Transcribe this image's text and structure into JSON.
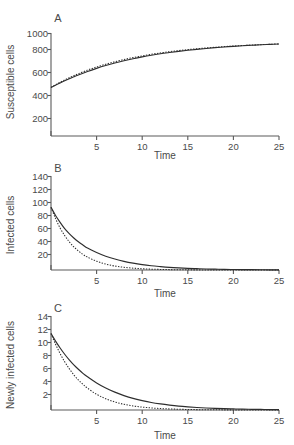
{
  "figure": {
    "background_color": "#ffffff",
    "axis_color": "#5a5a5a",
    "curve_color": "#2e2e2e",
    "panel_count": 3
  },
  "chart_data": [
    {
      "type": "line",
      "panel": "A",
      "title": "",
      "xlabel": "Time",
      "ylabel": "Susceptible cells",
      "xlim": [
        0,
        25
      ],
      "ylim": [
        0,
        1060
      ],
      "xticks": [
        5,
        10,
        15,
        20,
        25
      ],
      "yticks": [
        200,
        400,
        600,
        800,
        1000
      ],
      "grid": false,
      "legend": "none",
      "x": [
        0,
        0.5,
        1,
        1.5,
        2,
        2.5,
        3,
        4,
        5,
        6,
        7,
        8,
        9,
        10,
        11,
        12,
        13,
        14,
        15,
        16,
        17,
        18,
        19,
        20,
        21,
        22,
        23,
        24,
        25
      ],
      "series": [
        {
          "name": "solid",
          "style": "solid",
          "values": [
            500,
            523,
            546,
            568,
            589,
            609,
            628,
            664,
            696,
            725,
            751,
            774,
            795,
            814,
            831,
            846,
            859,
            871,
            882,
            892,
            901,
            909,
            916,
            923,
            929,
            934,
            939,
            943,
            947
          ]
        },
        {
          "name": "dotted",
          "style": "dotted",
          "values": [
            500,
            527,
            553,
            577,
            600,
            621,
            641,
            678,
            710,
            739,
            764,
            787,
            807,
            825,
            841,
            855,
            868,
            879,
            889,
            898,
            906,
            913,
            920,
            926,
            931,
            936,
            940,
            944,
            948
          ]
        }
      ]
    },
    {
      "type": "line",
      "panel": "B",
      "title": "",
      "xlabel": "Time",
      "ylabel": "Infected cells",
      "xlim": [
        0,
        25
      ],
      "ylim": [
        0,
        150
      ],
      "xticks": [
        5,
        10,
        15,
        20,
        25
      ],
      "yticks": [
        20,
        40,
        60,
        80,
        100,
        120,
        140
      ],
      "grid": false,
      "legend": "none",
      "x": [
        0,
        0.5,
        1,
        1.5,
        2,
        2.5,
        3,
        3.5,
        4,
        5,
        6,
        7,
        8,
        9,
        10,
        11,
        12,
        13,
        14,
        15,
        16,
        17,
        18,
        19,
        20,
        21,
        22,
        23,
        24,
        25
      ],
      "series": [
        {
          "name": "solid",
          "style": "solid",
          "values": [
            100,
            87,
            76,
            66,
            58,
            51,
            45,
            40,
            35,
            28,
            22,
            17.5,
            13.8,
            10.9,
            8.6,
            6.8,
            5.4,
            4.2,
            3.3,
            2.6,
            2.1,
            1.6,
            1.3,
            1.0,
            0.8,
            0.6,
            0.5,
            0.4,
            0.3,
            0.25
          ]
        },
        {
          "name": "dotted",
          "style": "dotted",
          "values": [
            100,
            82,
            67,
            55,
            45,
            37,
            30.5,
            25,
            20.5,
            14,
            9.4,
            6.3,
            4.3,
            2.9,
            2.0,
            1.35,
            0.9,
            0.62,
            0.42,
            0.28,
            0.19,
            0.13,
            0.09,
            0.06,
            0.04,
            0.03,
            0.02,
            0.015,
            0.01,
            0.008
          ]
        }
      ]
    },
    {
      "type": "line",
      "panel": "C",
      "title": "",
      "xlabel": "Time",
      "ylabel": "Newly infected cells",
      "xlim": [
        0,
        25
      ],
      "ylim": [
        0,
        15
      ],
      "xticks": [
        5,
        10,
        15,
        20,
        25
      ],
      "yticks": [
        2,
        4,
        6,
        8,
        10,
        12,
        14
      ],
      "grid": false,
      "legend": "none",
      "x": [
        0,
        0.5,
        1,
        1.5,
        2,
        2.5,
        3,
        3.5,
        4,
        5,
        6,
        7,
        8,
        9,
        10,
        11,
        12,
        13,
        14,
        15,
        16,
        17,
        18,
        19,
        20,
        21,
        22,
        23,
        24,
        25
      ],
      "series": [
        {
          "name": "solid",
          "style": "solid",
          "values": [
            12.2,
            11.0,
            9.9,
            8.9,
            8.0,
            7.2,
            6.5,
            5.85,
            5.3,
            4.3,
            3.5,
            2.85,
            2.3,
            1.85,
            1.5,
            1.2,
            0.97,
            0.78,
            0.62,
            0.5,
            0.4,
            0.32,
            0.26,
            0.21,
            0.17,
            0.13,
            0.11,
            0.09,
            0.07,
            0.06
          ]
        },
        {
          "name": "dotted",
          "style": "dotted",
          "values": [
            12.2,
            10.5,
            9.0,
            7.7,
            6.6,
            5.6,
            4.8,
            4.1,
            3.5,
            2.5,
            1.8,
            1.28,
            0.91,
            0.65,
            0.46,
            0.33,
            0.23,
            0.17,
            0.12,
            0.085,
            0.06,
            0.043,
            0.03,
            0.022,
            0.015,
            0.011,
            0.008,
            0.006,
            0.004,
            0.003
          ]
        }
      ]
    }
  ],
  "panels": [
    {
      "letter": "A",
      "ylabel": "Susceptible cells",
      "xlabel": "Time",
      "yticks": [
        "200",
        "400",
        "600",
        "800",
        "1000"
      ],
      "xticks": [
        "5",
        "10",
        "15",
        "20",
        "25"
      ]
    },
    {
      "letter": "B",
      "ylabel": "Infected cells",
      "xlabel": "Time",
      "yticks": [
        "20",
        "40",
        "60",
        "80",
        "100",
        "120",
        "140"
      ],
      "xticks": [
        "5",
        "10",
        "15",
        "20",
        "25"
      ]
    },
    {
      "letter": "C",
      "ylabel": "Newly infected cells",
      "xlabel": "Time",
      "yticks": [
        "2",
        "4",
        "6",
        "8",
        "10",
        "12",
        "14"
      ],
      "xticks": [
        "5",
        "10",
        "15",
        "20",
        "25"
      ]
    }
  ]
}
